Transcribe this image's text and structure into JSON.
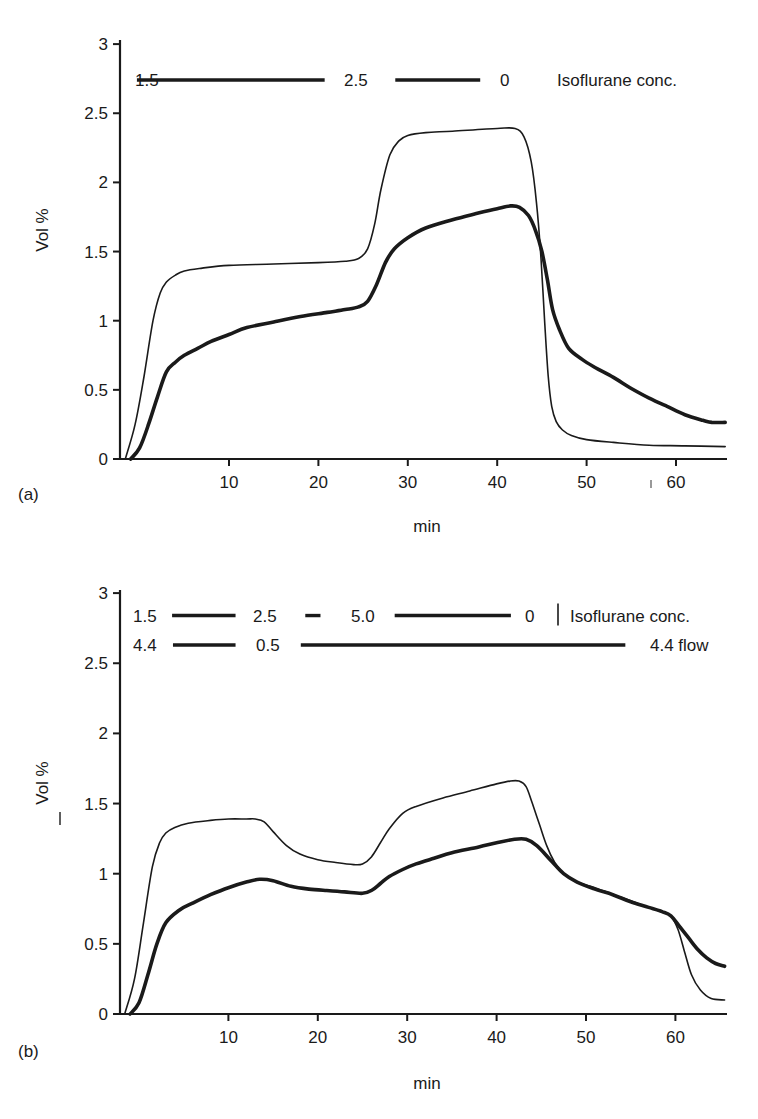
{
  "figure": {
    "panels": [
      {
        "id": "a",
        "label": "(a)"
      },
      {
        "id": "b",
        "label": "(b)"
      }
    ]
  },
  "chart_data": [
    {
      "type": "line",
      "panel_label": "(a)",
      "title": "",
      "xlabel": "min",
      "ylabel": "Vol %",
      "xlim": [
        -1.6,
        65.6
      ],
      "ylim": [
        0,
        3
      ],
      "x_ticks": [
        10,
        20,
        30,
        40,
        50,
        60
      ],
      "y_ticks": [
        0,
        0.5,
        1,
        1.5,
        2,
        2.5,
        3
      ],
      "y_tick_labels": [
        "0",
        "0.5",
        "1",
        "1.5",
        "2",
        "2.5",
        "3"
      ],
      "grid": false,
      "annotations": {
        "rows": [
          {
            "y_value": 2.74,
            "segments": [
              {
                "label": "1.5",
                "x_from": -0.3,
                "x_to": 20.7
              },
              {
                "label": "2.5",
                "x_from": 28.6,
                "x_to": 38.1
              },
              {
                "label": "0",
                "x_from": null,
                "x_to": null
              }
            ],
            "trailing_label": "Isoflurane conc."
          }
        ],
        "stray_marks": [
          {
            "x": 56.9,
            "y_value": -0.18,
            "text": "|"
          }
        ]
      },
      "series": [
        {
          "name": "Inspired concentration (thin)",
          "line": "thin",
          "x": [
            -1.6,
            -0.5,
            0.5,
            1.5,
            2.3,
            3.0,
            4.0,
            5.0,
            7.0,
            10,
            15,
            20,
            23,
            24.5,
            25.5,
            26.3,
            27,
            28,
            29,
            30,
            32,
            35,
            40,
            42,
            43,
            43.8,
            44.4,
            44.9,
            45.3,
            45.7,
            46.1,
            46.6,
            47.3,
            48.3,
            50,
            53,
            57,
            61,
            65.5
          ],
          "values": [
            0,
            0.25,
            0.6,
            1.0,
            1.2,
            1.28,
            1.33,
            1.36,
            1.38,
            1.4,
            1.41,
            1.42,
            1.43,
            1.45,
            1.52,
            1.7,
            1.95,
            2.2,
            2.3,
            2.34,
            2.36,
            2.37,
            2.39,
            2.39,
            2.33,
            2.15,
            1.85,
            1.45,
            1.0,
            0.6,
            0.38,
            0.27,
            0.21,
            0.17,
            0.14,
            0.12,
            0.1,
            0.095,
            0.09
          ]
        },
        {
          "name": "End-tidal concentration (thick)",
          "line": "thick",
          "x": [
            -1.0,
            0,
            1.0,
            2.0,
            3.0,
            4.0,
            5.0,
            6.5,
            8,
            10,
            12,
            15,
            18,
            21,
            23,
            24.5,
            25.5,
            26.5,
            27.5,
            28.5,
            30,
            32,
            35,
            38,
            40,
            41.5,
            42.5,
            43.5,
            44.3,
            45,
            45.6,
            46.2,
            47,
            48,
            49.5,
            51,
            53,
            55,
            57,
            59,
            61,
            63,
            64,
            65.5
          ],
          "values": [
            0,
            0.08,
            0.25,
            0.45,
            0.63,
            0.7,
            0.75,
            0.8,
            0.85,
            0.9,
            0.95,
            0.99,
            1.03,
            1.06,
            1.08,
            1.1,
            1.14,
            1.26,
            1.42,
            1.52,
            1.6,
            1.67,
            1.73,
            1.78,
            1.81,
            1.83,
            1.82,
            1.76,
            1.65,
            1.5,
            1.3,
            1.08,
            0.93,
            0.8,
            0.72,
            0.66,
            0.59,
            0.51,
            0.44,
            0.38,
            0.32,
            0.28,
            0.265,
            0.265
          ]
        }
      ]
    },
    {
      "type": "line",
      "panel_label": "(b)",
      "title": "",
      "xlabel": "min",
      "ylabel": "Vol %",
      "xlim": [
        -1.6,
        65.6
      ],
      "ylim": [
        0,
        3
      ],
      "x_ticks": [
        10,
        20,
        30,
        40,
        50,
        60
      ],
      "y_ticks": [
        0,
        0.5,
        1,
        1.5,
        2,
        2.5,
        3
      ],
      "y_tick_labels": [
        "0",
        "0.5",
        "1",
        "1.5",
        "2",
        "2.5",
        "3"
      ],
      "grid": false,
      "annotations": {
        "rows": [
          {
            "y_value": 2.84,
            "segments": [
              {
                "label": "1.5",
                "x_from": 3.7,
                "x_to": 10.8
              },
              {
                "label": "2.5",
                "x_from": 18.6,
                "x_to": 20.3
              },
              {
                "label": "5.0",
                "x_from": 28.6,
                "x_to": 41.6
              },
              {
                "label": "0",
                "x_from": null,
                "x_to": null
              }
            ],
            "divider_after_last": true,
            "trailing_label": "Isoflurane conc."
          },
          {
            "y_value": 2.63,
            "segments": [
              {
                "label": "4.4",
                "x_from": 3.8,
                "x_to": 10.8
              },
              {
                "label": "0.5",
                "x_from": 18.1,
                "x_to": 54.4
              },
              {
                "label": "4.4 flow",
                "x_from": null,
                "x_to": null
              }
            ],
            "trailing_label": ""
          }
        ],
        "stray_marks": [
          {
            "y_value": 1.45,
            "text": "|",
            "position": "beside y-axis label"
          }
        ]
      },
      "series": [
        {
          "name": "Inspired concentration (thin)",
          "line": "thin",
          "x": [
            -1.6,
            -0.5,
            0.5,
            1.5,
            2.3,
            3.0,
            4.0,
            5.5,
            8,
            10,
            12,
            13,
            14,
            15,
            16.5,
            18,
            20,
            22,
            24,
            25,
            26,
            27,
            28,
            29.5,
            31,
            34,
            37,
            40,
            41.5,
            42.5,
            43.3,
            44,
            44.8,
            45.6,
            46.5,
            47.5,
            49,
            51,
            54,
            57,
            58.5,
            59.5,
            60.3,
            61,
            61.8,
            62.8,
            64,
            65.5
          ],
          "values": [
            0,
            0.25,
            0.65,
            1.05,
            1.22,
            1.29,
            1.33,
            1.36,
            1.38,
            1.39,
            1.39,
            1.39,
            1.37,
            1.3,
            1.2,
            1.14,
            1.1,
            1.08,
            1.065,
            1.07,
            1.12,
            1.22,
            1.32,
            1.43,
            1.48,
            1.54,
            1.59,
            1.64,
            1.66,
            1.66,
            1.62,
            1.5,
            1.35,
            1.2,
            1.08,
            1.0,
            0.94,
            0.9,
            0.83,
            0.76,
            0.73,
            0.7,
            0.6,
            0.45,
            0.28,
            0.17,
            0.11,
            0.1
          ]
        },
        {
          "name": "End-tidal concentration (thick)",
          "line": "thick",
          "x": [
            -1.0,
            0,
            1.0,
            2.0,
            3.0,
            4.5,
            6,
            8,
            10,
            12,
            13.5,
            15,
            17,
            19,
            21,
            23,
            25,
            26,
            27,
            28,
            29.5,
            31,
            33,
            35,
            38,
            40,
            42,
            43.3,
            44.5,
            46,
            47.5,
            49,
            51,
            53,
            55,
            57,
            58.5,
            59.5,
            60.5,
            61.5,
            62.5,
            63.5,
            64.5,
            65.5
          ],
          "values": [
            0,
            0.08,
            0.28,
            0.5,
            0.65,
            0.74,
            0.79,
            0.85,
            0.9,
            0.94,
            0.96,
            0.95,
            0.91,
            0.89,
            0.88,
            0.87,
            0.86,
            0.88,
            0.93,
            0.98,
            1.03,
            1.07,
            1.11,
            1.15,
            1.19,
            1.22,
            1.245,
            1.245,
            1.2,
            1.1,
            1.0,
            0.94,
            0.89,
            0.85,
            0.8,
            0.76,
            0.73,
            0.7,
            0.62,
            0.54,
            0.46,
            0.4,
            0.36,
            0.34
          ]
        }
      ]
    }
  ]
}
